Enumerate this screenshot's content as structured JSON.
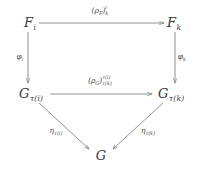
{
  "diagram": {
    "type": "commutative-diagram",
    "background_color": "#ffffff",
    "stroke_color": "#6e6e6e",
    "text_color": "#3a3a3a",
    "nodes": [
      {
        "id": "F_i",
        "label_base": "F",
        "label_sub": "i",
        "x": 30,
        "y": 22
      },
      {
        "id": "F_k",
        "label_base": "F",
        "label_sub": "k",
        "x": 174,
        "y": 22
      },
      {
        "id": "G_tau_i",
        "label_base": "G",
        "label_sub": "τ(i)",
        "x": 31,
        "y": 93
      },
      {
        "id": "G_tau_k",
        "label_base": "G",
        "label_sub": "τ(k)",
        "x": 171,
        "y": 93
      },
      {
        "id": "G",
        "label_base": "G",
        "label_sub": "",
        "x": 101,
        "y": 155
      }
    ],
    "edges": [
      {
        "id": "top-arrow",
        "from": "F_i",
        "to": "F_k",
        "label_base": "(ρ",
        "label_base_sub": "F",
        "label_close": ")",
        "label_sup": "i",
        "label_sub": "k",
        "label_x": 100,
        "label_y": 11,
        "x1": 39,
        "y1": 23,
        "x2": 164,
        "y2": 23
      },
      {
        "id": "middle-arrow",
        "from": "G_tau_i",
        "to": "G_tau_k",
        "label_base": "(ρ",
        "label_base_sub": "G",
        "label_close": ")",
        "label_sup": "τ(i)",
        "label_sub": "τ(k)",
        "label_x": 100,
        "label_y": 81,
        "x1": 50,
        "y1": 94,
        "x2": 152,
        "y2": 94
      },
      {
        "id": "left-vertical-arrow",
        "from": "F_i",
        "to": "G_tau_i",
        "label_base": "φ",
        "label_sub": "i",
        "label_sup": "",
        "label_x": 20,
        "label_y": 57,
        "x1": 28,
        "y1": 32,
        "x2": 28,
        "y2": 83
      },
      {
        "id": "right-vertical-arrow",
        "from": "F_k",
        "to": "G_tau_k",
        "label_base": "φ",
        "label_sub": "k",
        "label_sup": "",
        "label_x": 182,
        "label_y": 57,
        "x1": 175,
        "y1": 32,
        "x2": 175,
        "y2": 83
      },
      {
        "id": "left-diagonal-arrow",
        "from": "G_tau_i",
        "to": "G",
        "label_base": "η",
        "label_sub": "τ(i)",
        "label_sup": "",
        "label_x": 56,
        "label_y": 131,
        "x1": 39,
        "y1": 103,
        "x2": 89,
        "y2": 149
      },
      {
        "id": "right-diagonal-arrow",
        "from": "G_tau_k",
        "to": "G",
        "label_base": "η",
        "label_sub": "τ(k)",
        "label_sup": "",
        "label_x": 148,
        "label_y": 131,
        "x1": 163,
        "y1": 103,
        "x2": 113,
        "y2": 149
      }
    ]
  }
}
